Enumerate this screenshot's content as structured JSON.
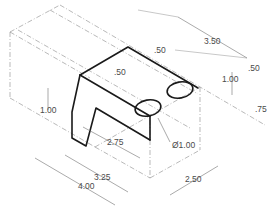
{
  "drawing": {
    "title": "Isometric view of bracket with dimensions",
    "colors": {
      "object_line": "#1a1a1a",
      "dimension_line": "#707070",
      "text": "#4a4a4a"
    },
    "dimensions": {
      "overall_length": "4.00",
      "slot_length": "3.25",
      "slot_inner": "2.75",
      "width": "2.50",
      "top_depth": "3.50",
      "top_edge_offset": ".50",
      "wall_thickness": ".50",
      "right_offset": ".50",
      "right_height": "1.00",
      "hole_offset": ".75",
      "left_height": "1.00",
      "hole_diameter": "Ø1.00"
    }
  }
}
